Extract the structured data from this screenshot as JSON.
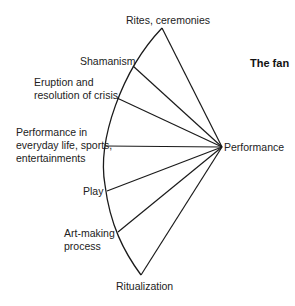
{
  "title": "The fan",
  "hub": {
    "label": "Performance",
    "x": 222,
    "y": 147
  },
  "arc": {
    "start": {
      "x": 162,
      "y": 28
    },
    "end": {
      "x": 141,
      "y": 275
    }
  },
  "spokes": [
    {
      "label": "Rites, ceremonies",
      "x": 162,
      "y": 28
    },
    {
      "label": "Shamanism",
      "x": 133,
      "y": 66
    },
    {
      "label": "Eruption and resolution of crisis",
      "x": 117,
      "y": 98
    },
    {
      "label": "Performance in everyday life, sports, entertainments",
      "x": 105,
      "y": 146
    },
    {
      "label": "Play",
      "x": 107,
      "y": 191
    },
    {
      "label": "Art-making process",
      "x": 118,
      "y": 232
    },
    {
      "label": "Ritualization",
      "x": 141,
      "y": 275
    }
  ],
  "labels": {
    "rites": "Rites, ceremonies",
    "shamanism": "Shamanism",
    "eruption_1": "Eruption and",
    "eruption_2": "resolution of crisis",
    "everyday_1": "Performance in",
    "everyday_2": "everyday life, sports,",
    "everyday_3": "entertainments",
    "play": "Play",
    "art_1": "Art-making",
    "art_2": "process",
    "ritualization": "Ritualization",
    "performance": "Performance"
  },
  "colors": {
    "line": "#1a1a1a",
    "background": "#ffffff"
  }
}
